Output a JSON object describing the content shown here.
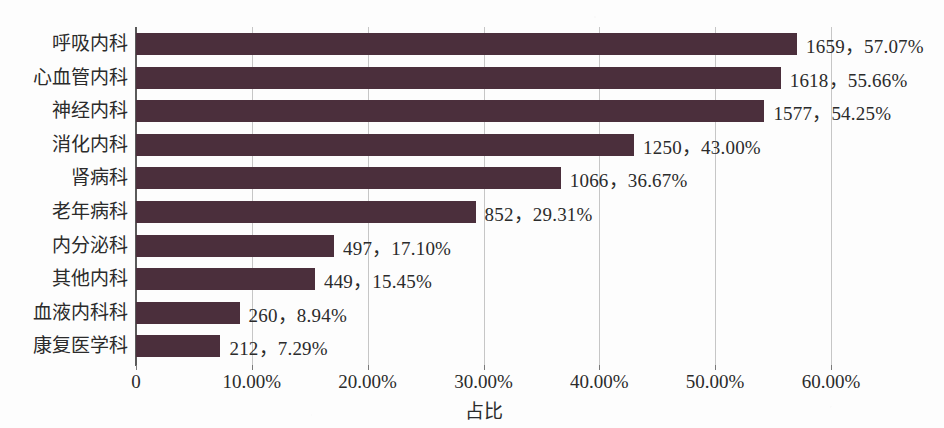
{
  "chart_data": {
    "type": "bar",
    "orientation": "horizontal",
    "title": "",
    "xlabel": "占比",
    "ylabel": "",
    "xlim": [
      0,
      0.65
    ],
    "grid": true,
    "legend": false,
    "bar_color": "#4b2f3c",
    "categories": [
      "呼吸内科",
      "心血管内科",
      "神经内科",
      "消化内科",
      "肾病科",
      "老年病科",
      "内分泌科",
      "其他内科",
      "血液内科科",
      "康复医学科"
    ],
    "counts": [
      1659,
      1618,
      1577,
      1250,
      1066,
      852,
      497,
      449,
      260,
      212
    ],
    "values": [
      57.07,
      55.66,
      54.25,
      43.0,
      36.67,
      29.31,
      17.1,
      15.45,
      8.94,
      7.29
    ],
    "data_labels": [
      "1659，57.07%",
      "1618，55.66%",
      "1577，54.25%",
      "1250，43.00%",
      "1066，36.67%",
      "852，29.31%",
      "497，17.10%",
      "449，15.45%",
      "260，8.94%",
      "212，7.29%"
    ],
    "xticks": [
      0,
      10,
      20,
      30,
      40,
      50,
      60
    ],
    "xtick_labels": [
      "0",
      "10.00%",
      "20.00%",
      "30.00%",
      "40.00%",
      "50.00%",
      "60.00%"
    ]
  }
}
